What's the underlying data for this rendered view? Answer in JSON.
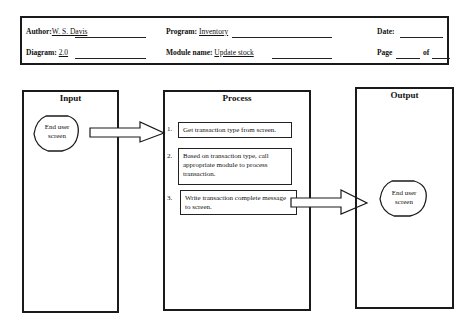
{
  "header": {
    "author_label": "Author:",
    "author_value": "W. S. Davis",
    "diagram_label": "Diagram:",
    "diagram_value": "2.0",
    "program_label": "Program:",
    "program_value": "Inventory",
    "module_label": "Module name:",
    "module_value": "Update stock",
    "date_label": "Date:",
    "date_value": "",
    "page_label": "Page",
    "of_label": "of",
    "page_value": "",
    "of_value": ""
  },
  "columns": {
    "input": {
      "title": "Input",
      "terminal": [
        "End user",
        "screen"
      ]
    },
    "process": {
      "title": "Process",
      "steps": [
        {
          "num": "1.",
          "text": "Get transaction type from screen."
        },
        {
          "num": "2.",
          "text": "Based on transaction type, call appropriate module to process transaction."
        },
        {
          "num": "3.",
          "text": "Write transaction complete message to screen."
        }
      ]
    },
    "output": {
      "title": "Output",
      "terminal": [
        "End user",
        "screen"
      ]
    }
  }
}
